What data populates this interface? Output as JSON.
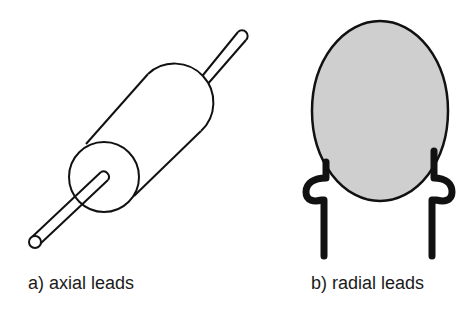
{
  "figure": {
    "panels": [
      {
        "id": "a",
        "caption": "a) axial leads",
        "component": "cylindrical-axial-component"
      },
      {
        "id": "b",
        "caption": "b) radial leads",
        "component": "disc-radial-component"
      }
    ],
    "colors": {
      "stroke": "#111111",
      "fill_body": "#d0d0d0",
      "background": "#ffffff"
    }
  }
}
